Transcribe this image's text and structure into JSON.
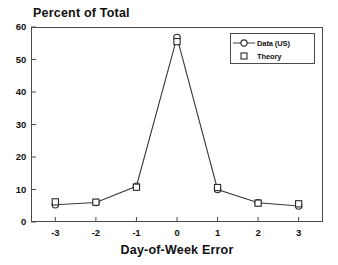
{
  "chart_data": {
    "type": "line",
    "title": "Percent of Total",
    "xlabel": "Day-of-Week Error",
    "ylabel": "",
    "x": [
      -3,
      -2,
      -1,
      0,
      1,
      2,
      3
    ],
    "xtick_labels": [
      "-3",
      "-2",
      "-1",
      "0",
      "1",
      "2",
      "3"
    ],
    "ytick_labels": [
      "0",
      "10",
      "20",
      "30",
      "40",
      "50",
      "60"
    ],
    "yticks": [
      0,
      10,
      20,
      30,
      40,
      50,
      60
    ],
    "xlim": [
      -3.6,
      3.6
    ],
    "ylim": [
      0,
      60
    ],
    "grid": false,
    "legend_position": "upper right",
    "series": [
      {
        "name": "Data (US)",
        "marker": "circle",
        "line": true,
        "values": [
          5.3,
          6.0,
          11.0,
          56.8,
          10.0,
          5.9,
          4.9
        ]
      },
      {
        "name": "Theory",
        "marker": "square",
        "line": false,
        "values": [
          6.2,
          6.1,
          10.7,
          55.5,
          10.6,
          5.8,
          5.6
        ]
      }
    ],
    "colors": {
      "axis": "#4a4a4a",
      "line": "#3a3a3a",
      "marker": "#2a2a2a",
      "text": "#101010",
      "background": "#ffffff"
    }
  },
  "legend": {
    "entries": [
      {
        "label": "Data (US)"
      },
      {
        "label": "Theory"
      }
    ]
  }
}
